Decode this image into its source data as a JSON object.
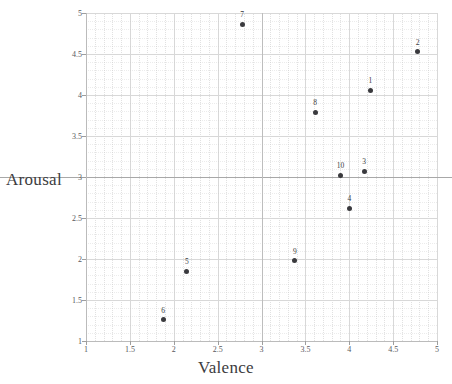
{
  "chart_data": {
    "type": "scatter",
    "title": "",
    "xlabel": "Valence",
    "ylabel": "Arousal",
    "xlim": [
      1,
      5
    ],
    "ylim": [
      1,
      5
    ],
    "xticks": [
      "1",
      "1.5",
      "2",
      "2.5",
      "3",
      "3.5",
      "4",
      "4.5",
      "5"
    ],
    "xtick_values": [
      1,
      1.5,
      2,
      2.5,
      3,
      3.5,
      4,
      4.5,
      5
    ],
    "yticks": [
      "1",
      "1.5",
      "2",
      "2.5",
      "3",
      "3.5",
      "4",
      "4.5",
      "5"
    ],
    "ytick_values": [
      1,
      1.5,
      2,
      2.5,
      3,
      3.5,
      4,
      4.5,
      5
    ],
    "grid": true,
    "legend": "none",
    "reference_lines": {
      "horizontal": 3,
      "vertical": 3
    },
    "marker_color": "#3a3a3e",
    "grid_color": "#c9c9c9",
    "axis_color": "#bbbbbb",
    "points": [
      {
        "label": "1",
        "x": 4.24,
        "y": 4.06
      },
      {
        "label": "2",
        "x": 4.78,
        "y": 4.53
      },
      {
        "label": "3",
        "x": 4.17,
        "y": 3.07
      },
      {
        "label": "4",
        "x": 4.0,
        "y": 2.62
      },
      {
        "label": "5",
        "x": 2.15,
        "y": 1.85
      },
      {
        "label": "6",
        "x": 1.88,
        "y": 1.26
      },
      {
        "label": "7",
        "x": 2.78,
        "y": 4.86
      },
      {
        "label": "8",
        "x": 3.61,
        "y": 3.79
      },
      {
        "label": "9",
        "x": 3.38,
        "y": 1.98
      },
      {
        "label": "10",
        "x": 3.9,
        "y": 3.02
      }
    ]
  }
}
